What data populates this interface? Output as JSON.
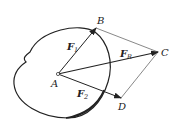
{
  "diagram": {
    "type": "parallelogram-of-forces",
    "points": {
      "A": {
        "label": "A",
        "x": 58,
        "y": 74
      },
      "B": {
        "label": "B",
        "x": 96,
        "y": 28
      },
      "C": {
        "label": "C",
        "x": 158,
        "y": 52
      },
      "D": {
        "label": "D",
        "x": 121,
        "y": 98
      }
    },
    "vectors": [
      {
        "name": "F1",
        "main": "F",
        "sub": "1",
        "from": "A",
        "to": "B"
      },
      {
        "name": "F2",
        "main": "F",
        "sub": "2",
        "from": "A",
        "to": "D"
      },
      {
        "name": "FR",
        "main": "F",
        "sub": "R",
        "from": "A",
        "to": "C"
      }
    ],
    "construction_lines": [
      {
        "from": "B",
        "to": "C"
      },
      {
        "from": "D",
        "to": "C"
      }
    ],
    "body": "rigid-body-outline",
    "colors": {
      "ink": "#222222",
      "thin": "#555555",
      "background": "#ffffff"
    }
  }
}
